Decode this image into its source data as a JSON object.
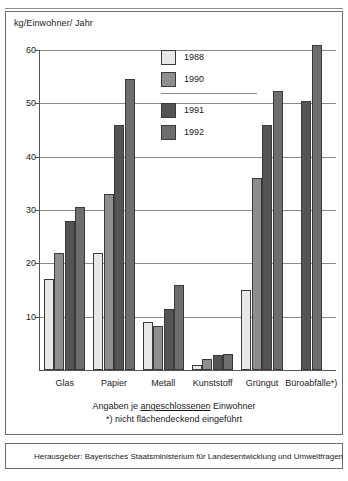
{
  "axis_unit_label": "kg/Einwohner/ Jahr",
  "legend": {
    "items": [
      {
        "label": "1988",
        "color": "#e8e8e6"
      },
      {
        "label": "1990",
        "color": "#8e8e8c"
      },
      {
        "label": "1991",
        "color": "#545452"
      },
      {
        "label": "1992",
        "color": "#6e6e6c"
      }
    ]
  },
  "notes": {
    "line1_prefix": "Angaben je ",
    "line1_underlined": "angeschlossenen",
    "line1_suffix": " Einwohner",
    "line2": "*) nicht flächendeckend eingeführt"
  },
  "publisher": {
    "text": "Herausgeber: Bayerisches Staatsministerium für Landesentwicklung und Umweltfragen"
  },
  "chart_data": {
    "type": "bar",
    "title": "",
    "xlabel": "",
    "ylabel": "kg/Einwohner/ Jahr",
    "ylim": [
      0,
      62
    ],
    "yticks": [
      10,
      20,
      30,
      40,
      50,
      60
    ],
    "ytick_labels": [
      "10",
      "20",
      "30",
      "40",
      "50",
      "60"
    ],
    "grid": true,
    "legend_position": "inside-top-center",
    "categories": [
      "Glas",
      "Papier",
      "Metall",
      "Kunststoff",
      "Grüngut",
      "Büroabfälle*)"
    ],
    "series": [
      {
        "name": "1988",
        "color": "#e8e8e6",
        "values": [
          17.0,
          22.0,
          9.0,
          1.0,
          15.0,
          null
        ]
      },
      {
        "name": "1990",
        "color": "#8e8e8c",
        "values": [
          22.0,
          33.0,
          8.3,
          2.0,
          36.0,
          null
        ]
      },
      {
        "name": "1991",
        "color": "#545452",
        "values": [
          28.0,
          46.0,
          11.5,
          2.8,
          46.0,
          50.5
        ]
      },
      {
        "name": "1992",
        "color": "#6e6e6c",
        "values": [
          30.5,
          54.5,
          16.0,
          3.0,
          52.3,
          61.0
        ]
      }
    ]
  }
}
